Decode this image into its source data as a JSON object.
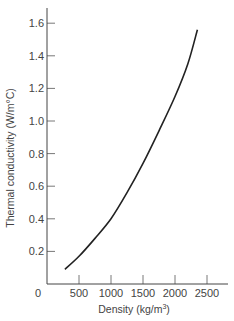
{
  "chart_data": {
    "type": "line",
    "title": "",
    "xlabel": "Density (kg/m³)",
    "ylabel": "Thermal conductivity (W/m°C)",
    "xlabel_parts": {
      "main": "Density (kg/m",
      "sup": "3",
      "end": ")"
    },
    "xlim": [
      0,
      2800
    ],
    "ylim": [
      0,
      1.65
    ],
    "x_ticks": [
      0,
      500,
      1000,
      1500,
      2000,
      2500
    ],
    "x_tick_labels": [
      "0",
      "500",
      "1000",
      "1500",
      "2000",
      "2500"
    ],
    "y_ticks": [
      0.2,
      0.4,
      0.6,
      0.8,
      1.0,
      1.2,
      1.4,
      1.6
    ],
    "y_tick_labels": [
      "0.2",
      "0.4",
      "0.6",
      "0.8",
      "1.0",
      "1.2",
      "1.4",
      "1.6"
    ],
    "grid": false,
    "legend": null,
    "series": [
      {
        "name": "Thermal conductivity vs density",
        "x": [
          280,
          500,
          750,
          1000,
          1250,
          1500,
          1750,
          2000,
          2200,
          2350
        ],
        "values": [
          0.09,
          0.17,
          0.28,
          0.4,
          0.56,
          0.74,
          0.94,
          1.15,
          1.35,
          1.56
        ]
      }
    ]
  }
}
